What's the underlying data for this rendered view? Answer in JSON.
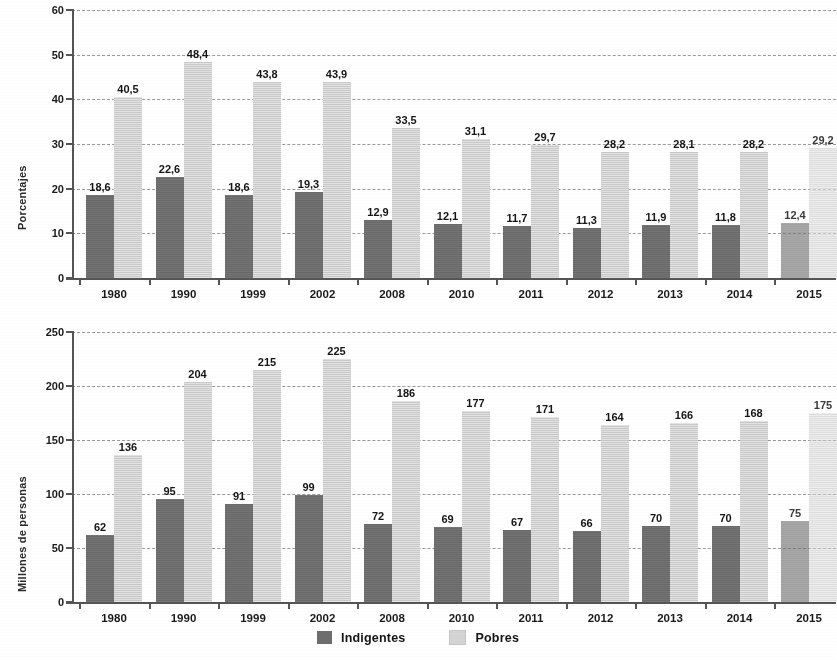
{
  "legend": {
    "items": [
      {
        "label": "Indigentes",
        "color": "#6d6d6d",
        "key": "indigentes"
      },
      {
        "label": "Pobres",
        "color": "#d4d4d4",
        "key": "pobres"
      }
    ]
  },
  "colors": {
    "indigentes": "#6d6d6d",
    "pobres": "#d4d4d4",
    "axis": "#555555",
    "grid": "#9a9a9a",
    "text": "#1a1a1a"
  },
  "chart_data": [
    {
      "id": "porcentajes",
      "type": "bar",
      "title": "",
      "xlabel": "",
      "ylabel": "Porcentajes",
      "ylim": [
        0,
        60
      ],
      "yticks": [
        0,
        10,
        20,
        30,
        40,
        50,
        60
      ],
      "ytick_labels": [
        "0",
        "10",
        "20",
        "30",
        "40",
        "50",
        "60"
      ],
      "grid": true,
      "legend_position": "bottom",
      "categories": [
        "1980",
        "1990",
        "1999",
        "2002",
        "2008",
        "2010",
        "2011",
        "2012",
        "2013",
        "2014",
        "2015"
      ],
      "series": [
        {
          "name": "Indigentes",
          "values": [
            18.6,
            22.6,
            18.6,
            19.3,
            12.9,
            12.1,
            11.7,
            11.3,
            11.9,
            11.8,
            12.4
          ],
          "labels": [
            "18,6",
            "22,6",
            "18,6",
            "19,3",
            "12,9",
            "12,1",
            "11,7",
            "11,3",
            "11,9",
            "11,8",
            "12,4"
          ]
        },
        {
          "name": "Pobres",
          "values": [
            40.5,
            48.4,
            43.8,
            43.9,
            33.5,
            31.1,
            29.7,
            28.2,
            28.1,
            28.2,
            29.2
          ],
          "labels": [
            "40,5",
            "48,4",
            "43,8",
            "43,9",
            "33,5",
            "31,1",
            "29,7",
            "28,2",
            "28,1",
            "28,2",
            "29,2"
          ]
        }
      ],
      "projected_categories": [
        "2015"
      ]
    },
    {
      "id": "millones",
      "type": "bar",
      "title": "",
      "xlabel": "",
      "ylabel": "Millones de personas",
      "ylim": [
        0,
        250
      ],
      "yticks": [
        0,
        50,
        100,
        150,
        200,
        250
      ],
      "ytick_labels": [
        "0",
        "50",
        "100",
        "150",
        "200",
        "250"
      ],
      "grid": true,
      "legend_position": "bottom",
      "categories": [
        "1980",
        "1990",
        "1999",
        "2002",
        "2008",
        "2010",
        "2011",
        "2012",
        "2013",
        "2014",
        "2015"
      ],
      "series": [
        {
          "name": "Indigentes",
          "values": [
            62,
            95,
            91,
            99,
            72,
            69,
            67,
            66,
            70,
            70,
            75
          ],
          "labels": [
            "62",
            "95",
            "91",
            "99",
            "72",
            "69",
            "67",
            "66",
            "70",
            "70",
            "75"
          ]
        },
        {
          "name": "Pobres",
          "values": [
            136,
            204,
            215,
            225,
            186,
            177,
            171,
            164,
            166,
            168,
            175
          ],
          "labels": [
            "136",
            "204",
            "215",
            "225",
            "186",
            "177",
            "171",
            "164",
            "166",
            "168",
            "175"
          ]
        }
      ],
      "projected_categories": [
        "2015"
      ]
    }
  ]
}
